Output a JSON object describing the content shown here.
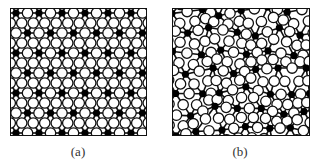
{
  "figure": {
    "panels": [
      {
        "id": "a",
        "label": "(a)",
        "description": "crystalline network",
        "type": "ordered",
        "frame": {
          "x": 10,
          "y": 8,
          "w": 137,
          "h": 128
        },
        "spacing_x": 23,
        "spacing_y": 20,
        "offset_x": 5,
        "offset_y": 4
      },
      {
        "id": "b",
        "label": "(b)",
        "description": "amorphous network",
        "type": "disordered",
        "frame": {
          "x": 172,
          "y": 8,
          "w": 138,
          "h": 128
        },
        "spacing_x": 23,
        "spacing_y": 20,
        "offset_x": 3,
        "offset_y": 2,
        "jitter": 5,
        "seed": 7
      }
    ],
    "legend": {
      "node_filled": "cation (black dot)",
      "node_open": "anion (open circle)"
    },
    "colors": {
      "line": "#111111",
      "fill_dark": "#000000",
      "fill_light": "#ffffff",
      "caption": "#333333"
    },
    "captions": {
      "a": "(a)",
      "b": "(b)"
    }
  }
}
